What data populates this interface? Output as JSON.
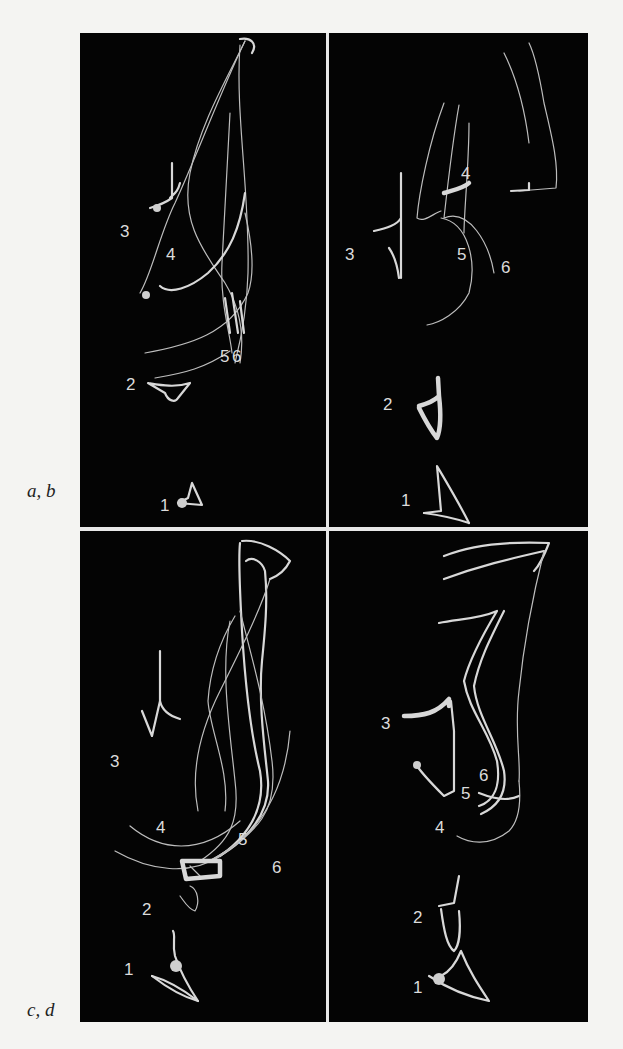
{
  "figure": {
    "row_labels": [
      "a, b",
      "c, d"
    ],
    "panels": [
      {
        "id": "a",
        "position": "top-left",
        "trace_labels": [
          "1",
          "2",
          "3",
          "4",
          "5",
          "6"
        ]
      },
      {
        "id": "b",
        "position": "top-right",
        "trace_labels": [
          "1",
          "2",
          "3",
          "4",
          "5",
          "6"
        ]
      },
      {
        "id": "c",
        "position": "bottom-left",
        "trace_labels": [
          "1",
          "2",
          "3",
          "4",
          "5",
          "6"
        ]
      },
      {
        "id": "d",
        "position": "bottom-right",
        "trace_labels": [
          "1",
          "2",
          "3",
          "4",
          "5",
          "6"
        ]
      }
    ],
    "colors": {
      "background": "#f4f4f2",
      "panel": "#040404",
      "trace": "#d8d8d8",
      "divider": "#e8e8e8"
    }
  }
}
